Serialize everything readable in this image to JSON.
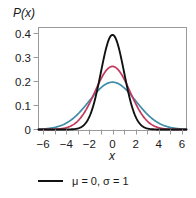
{
  "chart_data": {
    "type": "line",
    "title": "",
    "ylabel": "P(x)",
    "xlabel": "x",
    "xlim": [
      -6.4,
      6.4
    ],
    "ylim": [
      0,
      0.43
    ],
    "grid": false,
    "legend_position": "bottom",
    "x_ticks_major": [
      -6,
      -4,
      -2,
      0,
      2,
      4,
      6
    ],
    "x_tick_labels": [
      "−6",
      "−4",
      "−2",
      "0",
      "2",
      "4",
      "6"
    ],
    "x_ticks_minor": [
      -5,
      -3,
      -1,
      1,
      3,
      5
    ],
    "y_ticks": [
      0,
      0.1,
      0.2,
      0.3,
      0.4
    ],
    "y_tick_labels": [
      "0",
      "0.1",
      "0.2",
      "0.3",
      "0.4"
    ],
    "series": [
      {
        "name": "mu0-sigma1",
        "mu": 0,
        "sigma": 1,
        "color": "#111111",
        "peak": 0.399,
        "x": [
          -6,
          -5.5,
          -5,
          -4.5,
          -4,
          -3.5,
          -3,
          -2.5,
          -2,
          -1.5,
          -1,
          -0.5,
          0,
          0.5,
          1,
          1.5,
          2,
          2.5,
          3,
          3.5,
          4,
          4.5,
          5,
          5.5,
          6
        ],
        "y": [
          0.0,
          0.0,
          0.0,
          0.0,
          0.0,
          0.001,
          0.004,
          0.018,
          0.054,
          0.13,
          0.242,
          0.352,
          0.399,
          0.352,
          0.242,
          0.13,
          0.054,
          0.018,
          0.004,
          0.001,
          0.0,
          0.0,
          0.0,
          0.0,
          0.0
        ]
      },
      {
        "name": "mu0-sigma1.5",
        "mu": 0,
        "sigma": 1.5,
        "color": "#c1395e",
        "peak": 0.266,
        "x": [
          -6,
          -5.5,
          -5,
          -4.5,
          -4,
          -3.5,
          -3,
          -2.5,
          -2,
          -1.5,
          -1,
          -0.5,
          0,
          0.5,
          1,
          1.5,
          2,
          2.5,
          3,
          3.5,
          4,
          4.5,
          5,
          5.5,
          6
        ],
        "y": [
          0.0,
          0.001,
          0.002,
          0.006,
          0.014,
          0.028,
          0.048,
          0.074,
          0.109,
          0.161,
          0.213,
          0.251,
          0.266,
          0.251,
          0.213,
          0.161,
          0.109,
          0.074,
          0.048,
          0.028,
          0.014,
          0.006,
          0.002,
          0.001,
          0.0
        ]
      },
      {
        "name": "mu0-sigma2",
        "mu": 0,
        "sigma": 2,
        "color": "#3f8ba8",
        "peak": 0.199,
        "x": [
          -6,
          -5.5,
          -5,
          -4.5,
          -4,
          -3.5,
          -3,
          -2.5,
          -2,
          -1.5,
          -1,
          -0.5,
          0,
          0.5,
          1,
          1.5,
          2,
          2.5,
          3,
          3.5,
          4,
          4.5,
          5,
          5.5,
          6
        ],
        "y": [
          0.002,
          0.005,
          0.009,
          0.016,
          0.027,
          0.043,
          0.065,
          0.091,
          0.121,
          0.151,
          0.176,
          0.193,
          0.199,
          0.193,
          0.176,
          0.151,
          0.121,
          0.091,
          0.065,
          0.043,
          0.027,
          0.016,
          0.009,
          0.005,
          0.002
        ]
      }
    ],
    "legend": [
      {
        "label": "μ = 0, σ = 1",
        "color": "#111111"
      }
    ]
  },
  "frame": {
    "color": "#9a9a9a"
  }
}
